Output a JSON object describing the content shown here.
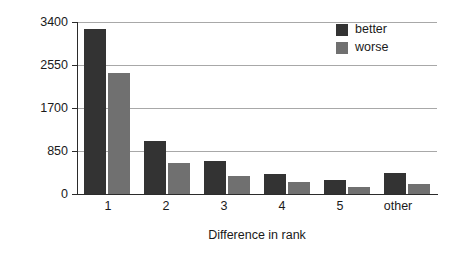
{
  "chart_data": {
    "type": "bar",
    "title": "",
    "xlabel": "Difference in rank",
    "ylabel": "# of queries",
    "categories": [
      "1",
      "2",
      "3",
      "4",
      "5",
      "other"
    ],
    "series": [
      {
        "name": "better",
        "color": "#333333",
        "values": [
          3270,
          1050,
          650,
          400,
          280,
          420
        ]
      },
      {
        "name": "worse",
        "color": "#707070",
        "values": [
          2400,
          610,
          355,
          240,
          140,
          200
        ]
      }
    ],
    "ylim": [
      0,
      3400
    ],
    "yticks": [
      0,
      850,
      1700,
      2550,
      3400
    ],
    "ytick_labels": [
      "0",
      "850",
      "1700",
      "2550",
      "3400"
    ],
    "grid": true,
    "legend_position": "top-right",
    "legend_entries": [
      "better",
      "worse"
    ]
  },
  "legend": {
    "items": [
      {
        "label": "better"
      },
      {
        "label": "worse"
      }
    ]
  },
  "axes": {
    "y_title": "# of queries",
    "x_title": "Difference in rank"
  }
}
